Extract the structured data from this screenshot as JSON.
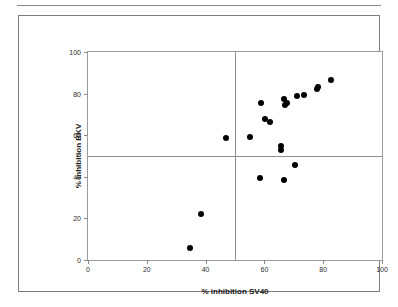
{
  "figure": {
    "background_color": "#ffffff",
    "frame_color": "#7d7d7d",
    "plot_frame_color": "#9a9a9a",
    "marker_color": "#000000",
    "reference_line_color": "#8f8f8f"
  },
  "chart_data": {
    "type": "scatter",
    "title": "",
    "xlabel": "% inhibition SV40",
    "ylabel": "% inhibition BKV",
    "xlim": [
      0,
      100
    ],
    "ylim": [
      0,
      100
    ],
    "xticks": [
      0,
      20,
      40,
      60,
      80,
      100
    ],
    "yticks": [
      0,
      20,
      40,
      60,
      80,
      100
    ],
    "xticklabels": [
      "0",
      "20",
      "40",
      "60",
      "80",
      "100"
    ],
    "yticklabels": [
      "0",
      "20",
      "40",
      "60",
      "80",
      "100"
    ],
    "grid": false,
    "legend": null,
    "reference_lines": {
      "vertical_x": 50,
      "horizontal_y": 50
    },
    "series": [
      {
        "name": "samples",
        "marker": "filled-circle",
        "color": "#000000",
        "points": [
          {
            "x": 34.8,
            "y": 6.0
          },
          {
            "x": 38.6,
            "y": 22.2
          },
          {
            "x": 46.8,
            "y": 58.8
          },
          {
            "x": 55.0,
            "y": 59.2
          },
          {
            "x": 58.6,
            "y": 39.3
          },
          {
            "x": 58.8,
            "y": 75.5
          },
          {
            "x": 60.3,
            "y": 67.7
          },
          {
            "x": 61.9,
            "y": 66.2
          },
          {
            "x": 65.6,
            "y": 54.9
          },
          {
            "x": 65.8,
            "y": 53.1
          },
          {
            "x": 66.8,
            "y": 38.7
          },
          {
            "x": 66.8,
            "y": 77.4
          },
          {
            "x": 66.9,
            "y": 74.5
          },
          {
            "x": 67.7,
            "y": 75.3
          },
          {
            "x": 70.4,
            "y": 45.9
          },
          {
            "x": 71.2,
            "y": 78.8
          },
          {
            "x": 73.6,
            "y": 79.2
          },
          {
            "x": 77.8,
            "y": 82.2
          },
          {
            "x": 78.2,
            "y": 83.3
          },
          {
            "x": 82.5,
            "y": 86.3
          }
        ]
      }
    ]
  }
}
